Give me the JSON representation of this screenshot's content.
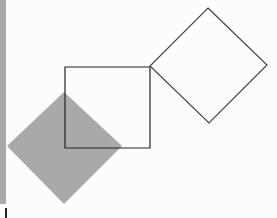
{
  "diagram": {
    "shapes": [
      {
        "type": "diamond",
        "fill": "#a9a9a9",
        "stroke": "none",
        "points": [
          [
            64,
            92
          ],
          [
            122,
            146
          ],
          [
            64,
            204
          ],
          [
            7,
            146
          ]
        ]
      },
      {
        "type": "square",
        "fill": "none",
        "stroke": "#222222",
        "points": [
          [
            65,
            67
          ],
          [
            150,
            67
          ],
          [
            150,
            148
          ],
          [
            65,
            148
          ]
        ]
      },
      {
        "type": "diamond",
        "fill": "none",
        "stroke": "#444444",
        "points": [
          [
            208,
            8
          ],
          [
            267,
            65
          ],
          [
            209,
            123
          ],
          [
            150,
            66
          ]
        ]
      }
    ],
    "colors": {
      "background": "#fcfcfc",
      "gray_fill": "#a9a9a9",
      "left_bar": "#a8a8a8"
    }
  }
}
